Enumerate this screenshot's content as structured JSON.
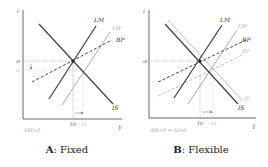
{
  "panels": [
    {
      "id": "A",
      "letter": "A",
      "caption": ": Fixed",
      "note": "ΔM>0",
      "axis": {
        "y_label": "i",
        "x_label": "Y"
      },
      "labels": {
        "LM": "LM",
        "LM1": "LM'",
        "BP": "BP",
        "IS": "IS",
        "i0": "i0",
        "i1": "i1",
        "Y0": "Y0",
        "Y1": "Y1"
      }
    },
    {
      "id": "B",
      "letter": "B",
      "caption": ": Flexible",
      "note": "ΔM>0   ⇒ ΔI>0",
      "axis": {
        "y_label": "i",
        "x_label": "Y"
      },
      "labels": {
        "LM": "LM",
        "LM1": "LM'",
        "BP": "BP",
        "BP1": "BP'",
        "IS": "IS",
        "IS1": "IS'",
        "i0": "i0",
        "Y0": "Y0",
        "Y1": "Y1"
      }
    }
  ],
  "colors": {
    "primary_line": "#444444",
    "shifted_line": "#aaaaaa",
    "axis": "#555555",
    "guide": "#999999"
  }
}
